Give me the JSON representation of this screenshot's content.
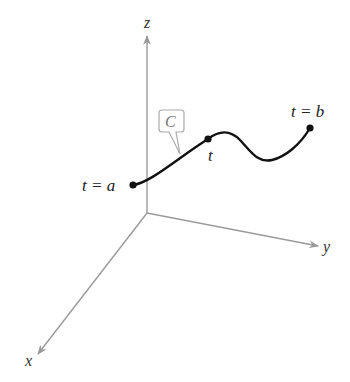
{
  "diagram": {
    "axes": {
      "x_label": "x",
      "y_label": "y",
      "z_label": "z",
      "color": "#9a9a9a"
    },
    "curve": {
      "name": "C",
      "color": "#111111",
      "start_label": "t = a",
      "mid_label": "t",
      "end_label": "t = b"
    },
    "callout_color": "#aaaaaa"
  }
}
